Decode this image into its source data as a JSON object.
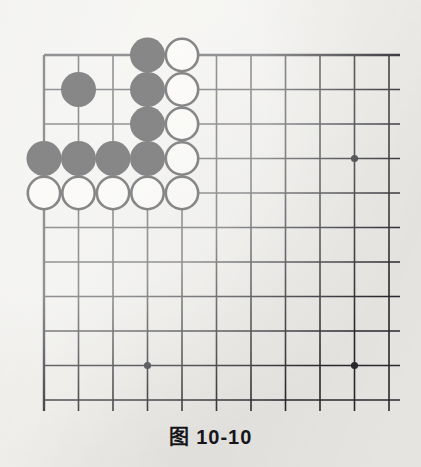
{
  "figure": {
    "caption": "图 10-10",
    "type": "go-board-diagram",
    "background_color": "#efeeea"
  },
  "board": {
    "name": "go-board",
    "line_color": "#2b2b30",
    "cols": 11,
    "rows": 11,
    "origin_x": 44,
    "origin_y": 55,
    "spacing": 34.5,
    "edge_top": true,
    "edge_left": true,
    "edge_right_open": true,
    "edge_bottom_open": true,
    "line_width_inner": 1.6,
    "line_width_edge": 2.4,
    "star_point_radius": 3.6,
    "star_points": [
      {
        "name": "star-point-right-upper",
        "col": 9,
        "row": 3
      },
      {
        "name": "star-point-bottom-left",
        "col": 3,
        "row": 9
      },
      {
        "name": "star-point-bottom-right",
        "col": 9,
        "row": 9
      }
    ]
  },
  "stones": {
    "radius": 17.5,
    "black_fill": "#111114",
    "white_fill": "#fbfaf7",
    "white_stroke": "#111114",
    "white_stroke_width": 2.6,
    "items": [
      {
        "name": "black-stone-c3-r0",
        "color": "black",
        "col": 3,
        "row": 0
      },
      {
        "name": "white-stone-c4-r0",
        "color": "white",
        "col": 4,
        "row": 0
      },
      {
        "name": "black-stone-c1-r1",
        "color": "black",
        "col": 1,
        "row": 1
      },
      {
        "name": "black-stone-c3-r1",
        "color": "black",
        "col": 3,
        "row": 1
      },
      {
        "name": "white-stone-c4-r1",
        "color": "white",
        "col": 4,
        "row": 1
      },
      {
        "name": "black-stone-c3-r2",
        "color": "black",
        "col": 3,
        "row": 2
      },
      {
        "name": "white-stone-c4-r2",
        "color": "white",
        "col": 4,
        "row": 2
      },
      {
        "name": "black-stone-c0-r3",
        "color": "black",
        "col": 0,
        "row": 3
      },
      {
        "name": "black-stone-c1-r3",
        "color": "black",
        "col": 1,
        "row": 3
      },
      {
        "name": "black-stone-c2-r3",
        "color": "black",
        "col": 2,
        "row": 3
      },
      {
        "name": "black-stone-c3-r3",
        "color": "black",
        "col": 3,
        "row": 3
      },
      {
        "name": "white-stone-c4-r3",
        "color": "white",
        "col": 4,
        "row": 3
      },
      {
        "name": "white-stone-c0-r4",
        "color": "white",
        "col": 0,
        "row": 4
      },
      {
        "name": "white-stone-c1-r4",
        "color": "white",
        "col": 1,
        "row": 4
      },
      {
        "name": "white-stone-c2-r4",
        "color": "white",
        "col": 2,
        "row": 4
      },
      {
        "name": "white-stone-c3-r4",
        "color": "white",
        "col": 3,
        "row": 4
      },
      {
        "name": "white-stone-c4-r4",
        "color": "white",
        "col": 4,
        "row": 4
      }
    ]
  }
}
